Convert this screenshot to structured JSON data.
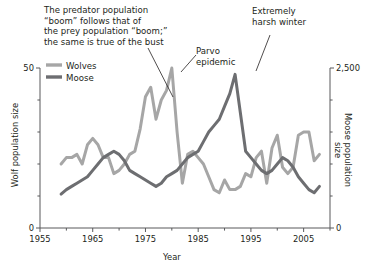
{
  "chart_data": {
    "type": "line",
    "title": "",
    "xlabel": "Year",
    "ylabel_left": "Wolf population size",
    "ylabel_right": "Moose population size",
    "xlim": [
      1955,
      2010
    ],
    "xticks": [
      1955,
      1965,
      1975,
      1985,
      1995,
      2005
    ],
    "xtick_labels": [
      "1955",
      "1965",
      "1975",
      "1985",
      "1995",
      "2005"
    ],
    "xminor_ticks": [
      1960,
      1970,
      1980,
      1990,
      2000,
      2010
    ],
    "ylim_left": [
      0,
      50
    ],
    "yticks_left": [
      0,
      50
    ],
    "ytick_labels_left": [
      "0",
      "50"
    ],
    "yminor_ticks_left": [
      10,
      20,
      30,
      40
    ],
    "ylim_right": [
      0,
      2500
    ],
    "yticks_right": [
      0,
      2500
    ],
    "ytick_labels_right": [
      "0",
      "2,500"
    ],
    "yminor_ticks_right": [
      500,
      1000,
      1500,
      2000
    ],
    "grid": false,
    "legend_position": "upper-left",
    "series": [
      {
        "name": "Wolves",
        "axis": "left",
        "color": "#a6a6a6",
        "x": [
          1959,
          1960,
          1961,
          1962,
          1963,
          1964,
          1965,
          1966,
          1967,
          1968,
          1969,
          1970,
          1971,
          1972,
          1973,
          1974,
          1975,
          1976,
          1977,
          1978,
          1979,
          1980,
          1981,
          1982,
          1983,
          1984,
          1985,
          1986,
          1987,
          1988,
          1989,
          1990,
          1991,
          1992,
          1993,
          1994,
          1995,
          1996,
          1997,
          1998,
          1999,
          2000,
          2001,
          2002,
          2003,
          2004,
          2005,
          2006,
          2007,
          2008
        ],
        "values": [
          20,
          22,
          22,
          23,
          20,
          26,
          28,
          26,
          22,
          22,
          17,
          18,
          20,
          23,
          24,
          31,
          41,
          44,
          34,
          40,
          43,
          50,
          30,
          14,
          23,
          24,
          22,
          20,
          16,
          12,
          11,
          15,
          12,
          12,
          13,
          17,
          16,
          22,
          24,
          14,
          25,
          29,
          19,
          17,
          19,
          29,
          30,
          30,
          21,
          23
        ]
      },
      {
        "name": "Moose",
        "axis": "right",
        "color": "#6d6e71",
        "x": [
          1959,
          1960,
          1961,
          1962,
          1963,
          1964,
          1965,
          1966,
          1967,
          1968,
          1969,
          1970,
          1971,
          1972,
          1973,
          1974,
          1975,
          1976,
          1977,
          1978,
          1979,
          1980,
          1981,
          1982,
          1983,
          1984,
          1985,
          1986,
          1987,
          1988,
          1989,
          1990,
          1991,
          1992,
          1993,
          1994,
          1995,
          1996,
          1997,
          1998,
          1999,
          2000,
          2001,
          2002,
          2003,
          2004,
          2005,
          2006,
          2007,
          2008
        ],
        "values": [
          530,
          600,
          650,
          700,
          750,
          800,
          900,
          1000,
          1100,
          1150,
          1200,
          1150,
          1050,
          900,
          850,
          800,
          750,
          700,
          650,
          700,
          800,
          850,
          900,
          1000,
          1100,
          1150,
          1200,
          1350,
          1500,
          1600,
          1700,
          1900,
          2100,
          2400,
          1800,
          1200,
          1100,
          1000,
          900,
          850,
          900,
          1000,
          1100,
          1050,
          950,
          800,
          700,
          600,
          550,
          650
        ]
      }
    ],
    "annotations": [
      {
        "name": "boom-note",
        "text": "The predator population\n“boom” follows that of\nthe prey population “boom;”\nthe same is true of the bust"
      },
      {
        "name": "parvo-note",
        "text": "Parvo\nepidemic"
      },
      {
        "name": "harsh-winter-note",
        "text": "Extremely\nharsh winter"
      }
    ]
  },
  "legend": {
    "wolves": "Wolves",
    "moose": "Moose"
  },
  "colors": {
    "wolves": "#a6a6a6",
    "moose": "#6d6e71",
    "axis": "#58595b",
    "text": "#231f20"
  }
}
